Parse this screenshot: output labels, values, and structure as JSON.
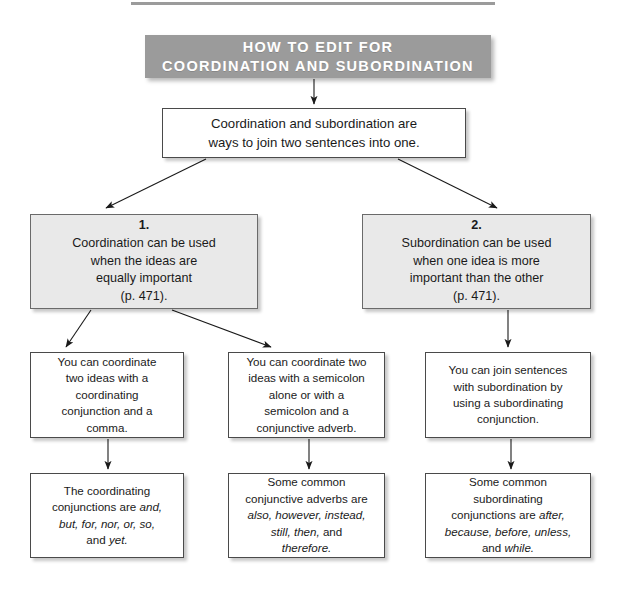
{
  "page": {
    "title_rule": "horizontal-rule",
    "accent_gray": "#9b9b9b",
    "shaded_fill": "#e9e9e9",
    "box_border": "#4a4a4a",
    "text_color": "#1a1a1a"
  },
  "banner": {
    "line1": "HOW TO EDIT FOR",
    "line2": "COORDINATION AND SUBORDINATION",
    "text": "HOW TO EDIT FOR\nCOORDINATION AND SUBORDINATION"
  },
  "intro": {
    "text": "Coordination and subordination are\nways to join two sentences into one."
  },
  "branches": [
    {
      "number": "1.",
      "text": "Coordination can be used\nwhen the ideas are\nequally important\n(p. 471)."
    },
    {
      "number": "2.",
      "text": "Subordination can be used\nwhen one idea is more\nimportant than the other\n(p. 471)."
    }
  ],
  "details": [
    {
      "text": "You can coordinate\ntwo ideas with a\ncoordinating\nconjunction and a\ncomma."
    },
    {
      "text": "You can coordinate two\nideas with a semicolon\nalone or with a\nsemicolon and a\nconjunctive adverb."
    },
    {
      "text": "You can join sentences\nwith subordination by\nusing a subordinating\nconjunction."
    }
  ],
  "examples": [
    {
      "plain_lead": "The coordinating\nconjunctions are ",
      "italics": "and,\nbut, for, nor, or, so,",
      "plain_tail": "\nand ",
      "italics_tail": "yet.",
      "text": "The coordinating conjunctions are and, but, for, nor, or, so, and yet."
    },
    {
      "plain_lead": "Some common\nconjunctive adverbs are\n",
      "italics": "also, however, instead,\nstill, then,",
      "plain_tail": " and\n",
      "italics_tail": "therefore.",
      "text": "Some common conjunctive adverbs are also, however, instead, still, then, and therefore."
    },
    {
      "plain_lead": "Some common\nsubordinating\nconjunctions are ",
      "italics": "after,\nbecause, before, unless,",
      "plain_tail": "\nand ",
      "italics_tail": "while.",
      "text": "Some common subordinating conjunctions are after, because, before, unless, and while."
    }
  ],
  "connectors": [
    {
      "name": "banner-to-intro",
      "kind": "vertical-arrow"
    },
    {
      "name": "intro-to-branch-1",
      "kind": "diagonal-arrow-left"
    },
    {
      "name": "intro-to-branch-2",
      "kind": "diagonal-arrow-right"
    },
    {
      "name": "branch1-to-detail-1",
      "kind": "diagonal-arrow-left"
    },
    {
      "name": "branch1-to-detail-2",
      "kind": "diagonal-arrow-right"
    },
    {
      "name": "branch2-to-detail-3",
      "kind": "vertical-arrow"
    },
    {
      "name": "detail1-to-example-1",
      "kind": "vertical-arrow"
    },
    {
      "name": "detail2-to-example-2",
      "kind": "vertical-arrow"
    },
    {
      "name": "detail3-to-example-3",
      "kind": "vertical-arrow"
    }
  ]
}
